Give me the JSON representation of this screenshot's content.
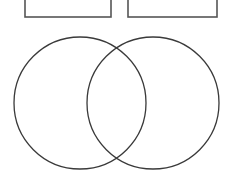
{
  "page": {
    "background_color": "#ffffff",
    "width": 232,
    "height": 185
  },
  "style": {
    "stroke_color": "#3a3a3a",
    "box_stroke_color": "#555555",
    "fill_color": "none",
    "stroke_width": 1.3,
    "box_stroke_width": 1.6
  },
  "label_boxes": [
    {
      "name": "label-box-left",
      "text": "",
      "x": 25,
      "y": -10,
      "width": 86,
      "height": 27
    },
    {
      "name": "label-box-right",
      "text": "",
      "x": 128,
      "y": -10,
      "width": 89,
      "height": 27
    }
  ],
  "venn": {
    "type": "two-set-venn",
    "circles": [
      {
        "name": "circle-left",
        "text": "",
        "cx": 80,
        "cy": 103,
        "r": 66
      },
      {
        "name": "circle-right",
        "text": "",
        "cx": 153,
        "cy": 103,
        "r": 66
      }
    ],
    "overlap": {
      "name": "circle-overlap",
      "text": ""
    },
    "intersection_points": [
      {
        "x": 116,
        "y": 37
      },
      {
        "x": 117,
        "y": 172
      }
    ]
  }
}
